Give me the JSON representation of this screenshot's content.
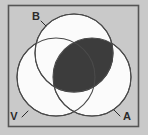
{
  "figure": {
    "kind": "venn-diagram",
    "width": 148,
    "height": 135,
    "background_color": "#c9c9c9",
    "frame_color": "#555555",
    "frame_fill": "#c9c9c9"
  },
  "sets": [
    {
      "id": "B",
      "label": "B",
      "position": "top",
      "cx": 74,
      "cy": 53,
      "r": 39,
      "fill": "#fbfbfb",
      "stroke": "#4a4a4a",
      "label_x": 36,
      "label_y": 20,
      "leader": {
        "x1": 41,
        "y1": 21,
        "x2": 46,
        "y2": 26
      }
    },
    {
      "id": "V",
      "label": "V",
      "position": "bottom-left",
      "cx": 56,
      "cy": 77,
      "r": 39,
      "fill": "#fbfbfb",
      "stroke": "#4a4a4a",
      "label_x": 14,
      "label_y": 120,
      "leader": {
        "x1": 22,
        "y1": 117,
        "x2": 28,
        "y2": 111
      }
    },
    {
      "id": "A",
      "label": "A",
      "position": "bottom-right",
      "cx": 92,
      "cy": 77,
      "r": 39,
      "fill": "#fbfbfb",
      "stroke": "#4a4a4a",
      "label_x": 127,
      "label_y": 120,
      "leader": {
        "x1": 120,
        "y1": 116,
        "x2": 114,
        "y2": 110
      }
    }
  ],
  "shaded_regions": [
    {
      "id": "B-and-A",
      "description": "Intersection of set B and set A",
      "sets": [
        "B",
        "A"
      ],
      "fill": "#3c3c3c"
    }
  ],
  "labels": {
    "top": "B",
    "bottom_left": "V",
    "bottom_right": "A"
  },
  "colors": {
    "background": "#c9c9c9",
    "circle_fill": "#fbfbfb",
    "circle_stroke": "#4a4a4a",
    "shaded_fill": "#3c3c3c",
    "label_text": "#2b2b2b",
    "frame": "#555555"
  }
}
